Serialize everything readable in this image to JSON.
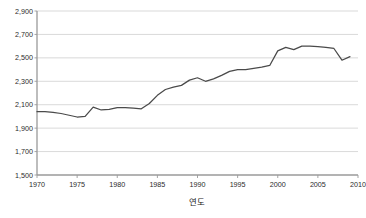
{
  "chart_data": {
    "type": "line",
    "title": "",
    "subtitle": "",
    "xlabel": "연도",
    "ylabel": "",
    "xlim": [
      1970,
      2010
    ],
    "ylim": [
      1500,
      2900
    ],
    "grid": true,
    "legend": false,
    "legend_position": "none",
    "series_color": "#4a4a4a",
    "grid_color": "#c9c9c9",
    "axis_color": "#9a9a9a",
    "y_ticks": [
      "1,500",
      "1,700",
      "1,900",
      "2,100",
      "2,300",
      "2,500",
      "2,700",
      "2,900"
    ],
    "y_tick_values": [
      1500,
      1700,
      1900,
      2100,
      2300,
      2500,
      2700,
      2900
    ],
    "x_ticks": [
      "1970",
      "1975",
      "1980",
      "1985",
      "1990",
      "1995",
      "2000",
      "2005",
      "2010"
    ],
    "x_tick_values": [
      1970,
      1975,
      1980,
      1985,
      1990,
      1995,
      2000,
      2005,
      2010
    ],
    "x": [
      1970,
      1971,
      1972,
      1973,
      1974,
      1975,
      1976,
      1977,
      1978,
      1979,
      1980,
      1981,
      1982,
      1983,
      1984,
      1985,
      1986,
      1987,
      1988,
      1989,
      1990,
      1991,
      1992,
      1993,
      1994,
      1995,
      1996,
      1997,
      1998,
      1999,
      2000,
      2001,
      2002,
      2003,
      2004,
      2005,
      2006,
      2007,
      2008,
      2009
    ],
    "values": [
      2040,
      2040,
      2035,
      2025,
      2010,
      1995,
      2000,
      2080,
      2055,
      2060,
      2075,
      2075,
      2070,
      2065,
      2110,
      2180,
      2230,
      2250,
      2265,
      2310,
      2330,
      2300,
      2320,
      2350,
      2385,
      2400,
      2400,
      2410,
      2420,
      2435,
      2560,
      2590,
      2570,
      2600,
      2600,
      2595,
      2590,
      2580,
      2480,
      2510
    ]
  },
  "accessibility": {
    "description": "연도별 시계열 선 그래프"
  }
}
